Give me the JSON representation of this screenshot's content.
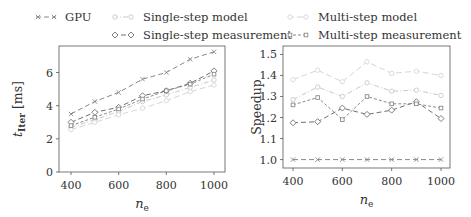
{
  "legend": {
    "items": [
      {
        "key": "gpu",
        "label": "GPU",
        "color": "#888888",
        "dash": "5,3",
        "marker": "x"
      },
      {
        "key": "ss_model",
        "label": "Single-step model",
        "color": "#c8c8c8",
        "dash": "5,2,1,2",
        "marker": "o-small"
      },
      {
        "key": "ss_meas",
        "label": "Single-step measurement",
        "color": "#707070",
        "dash": "5,3",
        "marker": "diamond"
      },
      {
        "key": "ms_model",
        "label": "Multi-step model",
        "color": "#d6d6d6",
        "dash": "6,3",
        "marker": "o-small"
      },
      {
        "key": "ms_meas",
        "label": "Multi-step measurement",
        "color": "#8a8a8a",
        "dash": "3,2",
        "marker": "square"
      }
    ]
  },
  "chart_data": [
    {
      "type": "line",
      "title": "",
      "xlabel": "n_e",
      "ylabel": "t_Iter [ms]",
      "x": [
        400,
        500,
        600,
        700,
        800,
        900,
        1000
      ],
      "xticks": [
        400,
        600,
        800,
        1000
      ],
      "yticks": [
        0,
        2,
        4,
        6
      ],
      "xlim": [
        370,
        1030
      ],
      "ylim": [
        0,
        7.6
      ],
      "grid": false,
      "series": [
        {
          "name": "GPU",
          "values": [
            3.5,
            4.25,
            4.8,
            5.6,
            6.0,
            6.8,
            7.25
          ]
        },
        {
          "name": "Single-step model",
          "values": [
            2.7,
            3.15,
            3.65,
            4.25,
            4.65,
            5.1,
            5.55
          ]
        },
        {
          "name": "Single-step measurement",
          "values": [
            3.0,
            3.6,
            3.9,
            4.6,
            4.9,
            5.35,
            6.1
          ]
        },
        {
          "name": "Multi-step model",
          "values": [
            2.55,
            3.0,
            3.45,
            3.85,
            4.3,
            4.85,
            5.25
          ]
        },
        {
          "name": "Multi-step measurement",
          "values": [
            2.8,
            3.3,
            3.8,
            4.4,
            4.9,
            5.3,
            5.9
          ]
        }
      ]
    },
    {
      "type": "line",
      "title": "",
      "xlabel": "n_e",
      "ylabel": "Speedup",
      "x": [
        400,
        500,
        600,
        700,
        800,
        900,
        1000
      ],
      "xticks": [
        400,
        600,
        800,
        1000
      ],
      "yticks": [
        1.0,
        1.1,
        1.2,
        1.3,
        1.4,
        1.5
      ],
      "xlim": [
        370,
        1030
      ],
      "ylim": [
        0.96,
        1.54
      ],
      "grid": false,
      "series": [
        {
          "name": "GPU",
          "values": [
            1.0,
            1.0,
            1.0,
            1.0,
            1.0,
            1.0,
            1.0
          ]
        },
        {
          "name": "Single-step model",
          "values": [
            1.285,
            1.345,
            1.3,
            1.365,
            1.325,
            1.33,
            1.305
          ]
        },
        {
          "name": "Single-step measurement",
          "values": [
            1.175,
            1.18,
            1.245,
            1.215,
            1.235,
            1.275,
            1.195
          ]
        },
        {
          "name": "Multi-step model",
          "values": [
            1.38,
            1.425,
            1.37,
            1.465,
            1.41,
            1.42,
            1.4
          ]
        },
        {
          "name": "Multi-step measurement",
          "values": [
            1.26,
            1.295,
            1.19,
            1.3,
            1.265,
            1.265,
            1.245
          ]
        }
      ]
    }
  ],
  "panels": [
    {
      "ylabel_main": "t",
      "ylabel_sub": "Iter",
      "ylabel_unit": "[ms]",
      "xlabel_main": "n",
      "xlabel_sub": "e",
      "ytick_labels": [
        "0",
        "2",
        "4",
        "6"
      ],
      "xtick_labels": [
        "400",
        "600",
        "800",
        "1000"
      ]
    },
    {
      "ylabel_main": "Speedup",
      "xlabel_main": "n",
      "xlabel_sub": "e",
      "ytick_labels": [
        "1.0",
        "1.1",
        "1.2",
        "1.3",
        "1.4",
        "1.5"
      ],
      "xtick_labels": [
        "400",
        "600",
        "800",
        "1000"
      ]
    }
  ]
}
